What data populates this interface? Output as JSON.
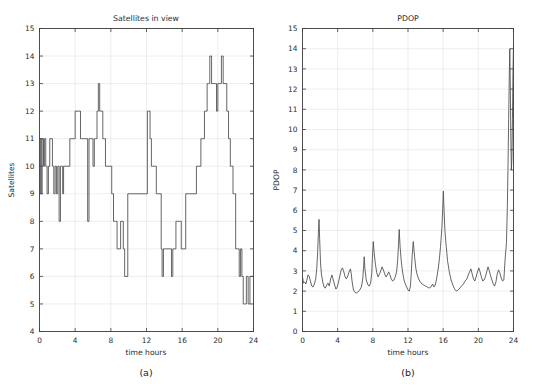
{
  "figure": {
    "width": 539,
    "height": 389,
    "background": "#ffffff",
    "line_color": "#4a4a4a",
    "axis_color": "#3c3c3c",
    "grid_color": "#e2e2e2"
  },
  "panels": [
    {
      "id": "a",
      "caption": "(a)",
      "title": "Satellites in view",
      "xlabel": "time hours",
      "ylabel": "Satellites"
    },
    {
      "id": "b",
      "caption": "(b)",
      "title": "PDOP",
      "xlabel": "time hours",
      "ylabel": "PDOP"
    }
  ],
  "chart_data": [
    {
      "type": "line",
      "drawstyle": "steps-post",
      "title": "Satellites in view",
      "xlabel": "time hours",
      "ylabel": "Satellites",
      "caption": "(a)",
      "xlim": [
        0,
        24
      ],
      "ylim": [
        4,
        15
      ],
      "xticks": [
        0,
        4,
        8,
        12,
        16,
        20,
        24
      ],
      "yticks": [
        4,
        5,
        6,
        7,
        8,
        9,
        10,
        11,
        12,
        13,
        14,
        15
      ],
      "grid": true,
      "legend": "none",
      "x": [
        0.0,
        0.1,
        0.2,
        0.3,
        0.45,
        0.55,
        0.7,
        0.85,
        1.0,
        1.15,
        1.3,
        1.45,
        1.6,
        1.75,
        1.9,
        2.05,
        2.2,
        2.35,
        2.5,
        2.6,
        2.7,
        2.85,
        3.0,
        3.2,
        3.4,
        3.6,
        3.8,
        4.0,
        4.2,
        4.4,
        4.6,
        4.8,
        5.0,
        5.2,
        5.4,
        5.55,
        5.7,
        5.85,
        6.0,
        6.15,
        6.3,
        6.45,
        6.6,
        6.75,
        6.9,
        7.0,
        7.1,
        7.25,
        7.4,
        7.55,
        7.7,
        7.9,
        8.1,
        8.3,
        8.5,
        8.7,
        8.9,
        9.1,
        9.25,
        9.4,
        9.55,
        9.7,
        9.9,
        10.2,
        10.6,
        11.0,
        11.4,
        11.8,
        12.1,
        12.25,
        12.4,
        12.55,
        12.7,
        12.9,
        13.1,
        13.3,
        13.5,
        13.65,
        13.75,
        13.9,
        14.1,
        14.3,
        14.5,
        14.65,
        14.8,
        14.95,
        15.1,
        15.3,
        15.5,
        15.7,
        15.9,
        16.1,
        16.4,
        16.8,
        17.2,
        17.6,
        17.9,
        18.1,
        18.3,
        18.5,
        18.65,
        18.8,
        18.95,
        19.1,
        19.3,
        19.5,
        19.7,
        19.85,
        20.0,
        20.2,
        20.4,
        20.6,
        20.8,
        21.0,
        21.2,
        21.4,
        21.55,
        21.7,
        21.85,
        22.0,
        22.2,
        22.4,
        22.55,
        22.7,
        22.85,
        23.0,
        23.2,
        23.4,
        23.6,
        23.8,
        24.0
      ],
      "y": [
        9,
        11,
        9,
        11,
        10,
        11,
        10,
        9,
        10,
        11,
        11,
        10,
        9,
        10,
        9,
        10,
        8,
        10,
        10,
        9,
        10,
        10,
        10,
        10,
        11,
        11,
        11,
        12,
        12,
        12,
        11,
        11,
        11,
        11,
        8,
        11,
        11,
        11,
        10,
        11,
        11,
        12,
        13,
        12,
        12,
        12,
        11,
        11,
        10,
        10,
        10,
        10,
        9,
        8,
        8,
        7,
        7,
        8,
        8,
        7,
        6,
        6,
        9,
        9,
        9,
        9,
        9,
        9,
        12,
        12,
        11,
        10,
        10,
        10,
        9,
        9,
        9,
        7,
        6,
        7,
        7,
        7,
        7,
        7,
        6,
        7,
        7,
        8,
        8,
        8,
        7,
        7,
        9,
        9,
        9,
        10,
        10,
        11,
        11,
        12,
        12,
        13,
        13,
        14,
        13,
        13,
        13,
        12,
        13,
        13,
        14,
        13,
        13,
        12,
        11,
        10,
        10,
        9,
        9,
        7,
        7,
        6,
        7,
        6,
        5,
        5,
        6,
        5,
        6,
        6,
        6
      ]
    },
    {
      "type": "line",
      "drawstyle": "default",
      "title": "PDOP",
      "xlabel": "time hours",
      "ylabel": "PDOP",
      "caption": "(b)",
      "xlim": [
        0,
        24
      ],
      "ylim": [
        0,
        15
      ],
      "xticks": [
        0,
        4,
        8,
        12,
        16,
        20,
        24
      ],
      "yticks": [
        0,
        1,
        2,
        3,
        4,
        5,
        6,
        7,
        8,
        9,
        10,
        11,
        12,
        13,
        14,
        15
      ],
      "grid": true,
      "legend": "none",
      "x": [
        0.0,
        0.12,
        0.25,
        0.38,
        0.5,
        0.62,
        0.75,
        0.9,
        1.05,
        1.2,
        1.35,
        1.5,
        1.62,
        1.72,
        1.8,
        1.88,
        1.95,
        2.05,
        2.15,
        2.3,
        2.45,
        2.6,
        2.75,
        2.9,
        3.05,
        3.2,
        3.35,
        3.5,
        3.65,
        3.8,
        3.95,
        4.1,
        4.25,
        4.4,
        4.55,
        4.7,
        4.85,
        5.0,
        5.15,
        5.3,
        5.45,
        5.55,
        5.62,
        5.7,
        5.8,
        5.95,
        6.1,
        6.3,
        6.5,
        6.7,
        6.85,
        6.95,
        7.02,
        7.1,
        7.25,
        7.45,
        7.6,
        7.75,
        7.88,
        7.95,
        8.05,
        8.15,
        8.3,
        8.45,
        8.6,
        8.75,
        8.9,
        9.05,
        9.2,
        9.35,
        9.5,
        9.65,
        9.8,
        9.95,
        10.1,
        10.25,
        10.4,
        10.55,
        10.7,
        10.82,
        10.92,
        11.0,
        11.1,
        11.25,
        11.4,
        11.55,
        11.7,
        11.85,
        12.0,
        12.15,
        12.28,
        12.38,
        12.48,
        12.6,
        12.75,
        12.9,
        13.05,
        13.2,
        13.4,
        13.6,
        13.8,
        14.0,
        14.2,
        14.4,
        14.6,
        14.8,
        14.95,
        15.1,
        15.25,
        15.4,
        15.55,
        15.7,
        15.85,
        15.95,
        16.02,
        16.1,
        16.2,
        16.35,
        16.5,
        16.7,
        16.9,
        17.1,
        17.3,
        17.5,
        17.7,
        17.9,
        18.1,
        18.3,
        18.5,
        18.7,
        18.85,
        19.0,
        19.15,
        19.3,
        19.45,
        19.6,
        19.75,
        19.9,
        20.05,
        20.2,
        20.35,
        20.5,
        20.65,
        20.8,
        20.95,
        21.1,
        21.25,
        21.4,
        21.55,
        21.7,
        21.85,
        22.0,
        22.15,
        22.3,
        22.45,
        22.6,
        22.75,
        22.9,
        23.05,
        23.2,
        23.3,
        23.38,
        23.45,
        23.52,
        23.58,
        23.64,
        23.7,
        23.76,
        23.82,
        23.88,
        23.94,
        24.0
      ],
      "y": [
        2.7,
        2.4,
        2.45,
        2.35,
        2.55,
        2.8,
        2.75,
        2.5,
        2.25,
        2.2,
        2.35,
        2.6,
        3.1,
        3.9,
        4.8,
        5.55,
        4.6,
        3.4,
        2.85,
        2.45,
        2.2,
        2.15,
        2.3,
        2.4,
        2.25,
        2.6,
        2.8,
        2.55,
        2.3,
        2.1,
        2.2,
        2.45,
        2.75,
        3.05,
        3.15,
        2.95,
        2.7,
        2.6,
        2.75,
        2.95,
        3.1,
        2.85,
        2.55,
        2.3,
        2.05,
        1.95,
        1.9,
        1.95,
        2.05,
        2.2,
        2.6,
        3.2,
        3.7,
        3.1,
        2.55,
        2.3,
        2.25,
        2.4,
        2.9,
        3.6,
        4.45,
        3.9,
        3.3,
        2.9,
        2.7,
        2.85,
        3.0,
        3.2,
        3.05,
        2.85,
        2.7,
        2.8,
        2.95,
        2.8,
        2.6,
        2.5,
        2.55,
        2.7,
        2.95,
        3.5,
        4.3,
        5.05,
        4.2,
        3.4,
        2.9,
        2.55,
        2.35,
        2.2,
        2.05,
        2.0,
        2.25,
        2.95,
        3.8,
        4.45,
        3.7,
        3.1,
        2.8,
        2.6,
        2.45,
        2.35,
        2.3,
        2.25,
        2.2,
        2.15,
        2.2,
        2.35,
        2.2,
        2.3,
        2.6,
        3.0,
        3.5,
        4.2,
        5.1,
        6.1,
        6.95,
        6.0,
        5.0,
        4.2,
        3.5,
        2.95,
        2.55,
        2.3,
        2.1,
        2.0,
        2.05,
        2.15,
        2.25,
        2.35,
        2.5,
        2.6,
        2.8,
        2.95,
        3.1,
        2.85,
        2.6,
        2.5,
        2.7,
        2.95,
        3.15,
        2.95,
        2.7,
        2.5,
        2.55,
        2.7,
        2.95,
        3.2,
        3.0,
        2.75,
        2.55,
        2.35,
        2.25,
        2.45,
        2.85,
        3.05,
        2.9,
        2.65,
        2.5,
        2.55,
        3.6,
        4.4,
        6.2,
        8.3,
        10.5,
        12.6,
        14.0,
        12.0,
        9.5,
        8.0,
        8.6,
        10.5,
        12.8,
        14.2
      ]
    }
  ]
}
